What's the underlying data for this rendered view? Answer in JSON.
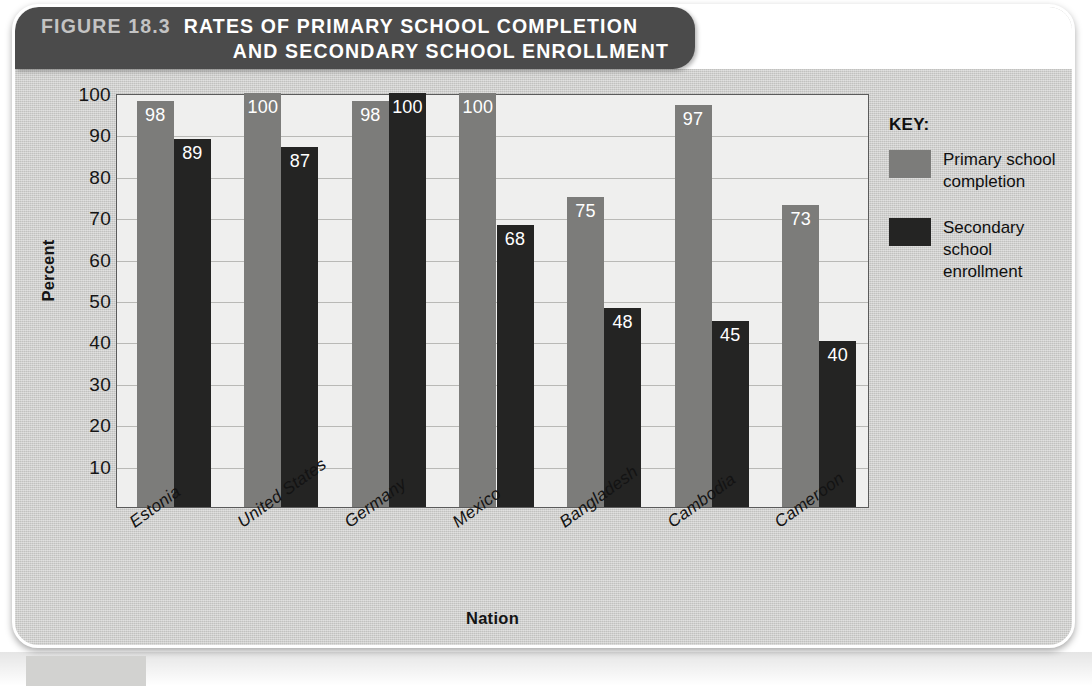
{
  "figure": {
    "number_label": "FIGURE 18.3",
    "title_line_1": "RATES OF PRIMARY SCHOOL COMPLETION",
    "title_line_2": "AND SECONDARY SCHOOL ENROLLMENT",
    "source": "Source: World Bank, 2014"
  },
  "legend": {
    "title": "KEY:",
    "items": [
      {
        "label": "Primary school completion",
        "color": "#7c7c7a"
      },
      {
        "label": "Secondary school enrollment",
        "color": "#242423"
      }
    ]
  },
  "colors": {
    "primary_bar": "#7c7c7a",
    "secondary_bar": "#242423",
    "plot_background": "#efefee",
    "panel_background": "#c9c9c7",
    "title_bar": "#4b4b4b",
    "gridline": "#b9b9b6"
  },
  "chart_data": {
    "type": "bar",
    "title": "RATES OF PRIMARY SCHOOL COMPLETION AND SECONDARY SCHOOL ENROLLMENT",
    "xlabel": "Nation",
    "ylabel": "Percent",
    "ylim": [
      0,
      100
    ],
    "yticks": [
      10,
      20,
      30,
      40,
      50,
      60,
      70,
      80,
      90,
      100
    ],
    "ytick_labels": [
      "10",
      "20",
      "30",
      "40",
      "50",
      "60",
      "70",
      "80",
      "90",
      "100"
    ],
    "grid": true,
    "legend_position": "right",
    "categories": [
      "Estonia",
      "United States",
      "Germany",
      "Mexico",
      "Bangladesh",
      "Cambodia",
      "Cameroon"
    ],
    "series": [
      {
        "name": "Primary school completion",
        "color": "#7c7c7a",
        "values": [
          98,
          100,
          98,
          100,
          75,
          97,
          73
        ]
      },
      {
        "name": "Secondary school enrollment",
        "color": "#242423",
        "values": [
          89,
          87,
          100,
          68,
          48,
          45,
          40
        ]
      }
    ],
    "source": "World Bank, 2014"
  }
}
